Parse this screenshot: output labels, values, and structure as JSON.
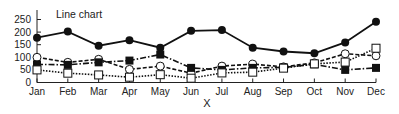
{
  "chart_data": {
    "type": "line",
    "title": "Line chart",
    "xlabel": "X",
    "ylabel": "",
    "categories": [
      "Jan",
      "Feb",
      "Mar",
      "Apr",
      "May",
      "Jun",
      "Jul",
      "Aug",
      "Sep",
      "Oct",
      "Nov",
      "Dec"
    ],
    "yticks": [
      0,
      50,
      100,
      150,
      200,
      250
    ],
    "ylim": [
      0,
      270
    ],
    "grid": false,
    "legend": "none",
    "series": [
      {
        "name": "Series 1",
        "marker": "filled-circle",
        "line_style": "solid",
        "values": [
          178,
          202,
          146,
          168,
          138,
          205,
          208,
          138,
          123,
          116,
          159,
          241
        ]
      },
      {
        "name": "Series 2",
        "marker": "open-circle",
        "line_style": "dashed",
        "values": [
          100,
          80,
          92,
          52,
          65,
          37,
          65,
          73,
          62,
          78,
          114,
          106
        ]
      },
      {
        "name": "Series 3",
        "marker": "filled-square",
        "line_style": "dash-dot",
        "values": [
          72,
          70,
          80,
          87,
          111,
          58,
          50,
          58,
          60,
          72,
          50,
          58
        ]
      },
      {
        "name": "Series 4",
        "marker": "open-square",
        "line_style": "dotted",
        "values": [
          50,
          37,
          30,
          21,
          31,
          17,
          38,
          41,
          57,
          74,
          81,
          136
        ]
      }
    ]
  },
  "colors": {
    "line": "#111111",
    "axis": "#222222",
    "background": "#ffffff"
  }
}
